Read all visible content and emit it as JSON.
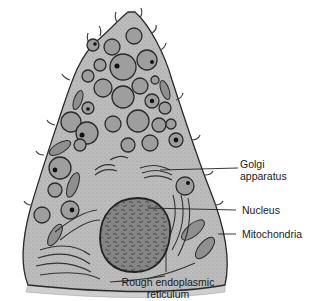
{
  "figure": {
    "colors": {
      "cytoplasm": "#bdbdbd",
      "granule": "#9e9e9e",
      "outline": "#2a2a2a",
      "nucleus": "#7a7a7a",
      "base": "#cfcfcf"
    }
  },
  "labels": {
    "golgi_line1": "Golgi",
    "golgi_line2": "apparatus",
    "nucleus": "Nucleus",
    "mitochondria": "Mitochondria",
    "rer_line1": "Rough endoplasmic",
    "rer_line2": "reticulum"
  }
}
